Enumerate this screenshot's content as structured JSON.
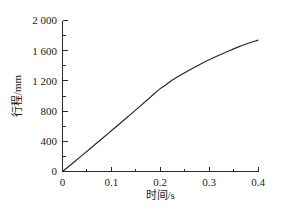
{
  "chart_data": {
    "type": "line",
    "title": "",
    "xlabel": "时间/s",
    "ylabel": "行程/mm",
    "xlim": [
      0,
      0.4
    ],
    "ylim": [
      0,
      2000
    ],
    "grid": false,
    "legend": null,
    "x_ticks": [
      0,
      0.1,
      0.2,
      0.3,
      0.4
    ],
    "x_tick_labels": [
      "0",
      "0.1",
      "0.2",
      "0.3",
      "0.4"
    ],
    "x_minor_step": 0.05,
    "y_ticks": [
      0,
      400,
      800,
      1200,
      1600,
      2000
    ],
    "y_tick_labels": [
      "0",
      "400",
      "800",
      "1 200",
      "1 600",
      "2 000"
    ],
    "y_minor_step": 200,
    "series": [
      {
        "name": "行程",
        "color": "#26262a",
        "x": [
          0,
          0.02,
          0.04,
          0.06,
          0.08,
          0.1,
          0.12,
          0.14,
          0.16,
          0.18,
          0.2,
          0.21,
          0.22,
          0.24,
          0.26,
          0.28,
          0.3,
          0.32,
          0.34,
          0.36,
          0.38,
          0.4
        ],
        "y": [
          0,
          106,
          214,
          322,
          430,
          540,
          650,
          760,
          872,
          985,
          1098,
          1140,
          1190,
          1270,
          1345,
          1415,
          1480,
          1540,
          1597,
          1650,
          1698,
          1740
        ]
      }
    ]
  },
  "axes": {
    "y_axis_title": "行程/mm",
    "x_axis_title": "时间/s"
  }
}
